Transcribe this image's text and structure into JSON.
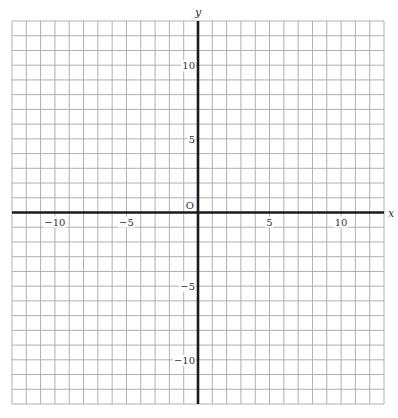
{
  "diagram": {
    "type": "coordinate-plane",
    "x_range": [
      -13,
      13
    ],
    "y_range": [
      -13,
      13
    ],
    "grid_step": 1,
    "origin_label": "O",
    "x_axis_label": "x",
    "y_axis_label": "y",
    "x_tick_labels": [
      {
        "value": -10,
        "text": "−10"
      },
      {
        "value": -5,
        "text": "−5"
      },
      {
        "value": 5,
        "text": "5"
      },
      {
        "value": 10,
        "text": "10"
      }
    ],
    "y_tick_labels": [
      {
        "value": 10,
        "text": "10"
      },
      {
        "value": 5,
        "text": "5"
      },
      {
        "value": -5,
        "text": "−5"
      },
      {
        "value": -10,
        "text": "−10"
      }
    ],
    "colors": {
      "grid": "#b0b0b0",
      "axis": "#1a1a1a",
      "text": "#333333",
      "background": "#ffffff"
    }
  },
  "layout_px": {
    "left": 12,
    "right": 384,
    "top": 21,
    "bottom": 404,
    "origin_x": 199,
    "origin_y": 212
  }
}
